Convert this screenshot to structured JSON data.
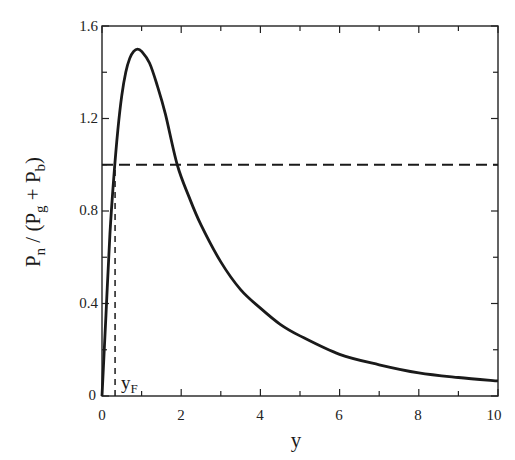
{
  "chart_data": {
    "type": "line",
    "title": "",
    "xlabel": "y",
    "ylabel": "P_n / (P_g + P_b)",
    "xlim": [
      0,
      10
    ],
    "ylim": [
      0,
      1.6
    ],
    "xticks": [
      0,
      2,
      4,
      6,
      8,
      10
    ],
    "xticks_minor": [
      1,
      3,
      5,
      7,
      9
    ],
    "yticks": [
      0,
      0.4,
      0.8,
      1.2,
      1.6
    ],
    "yticks_minor": [
      0.2,
      0.6,
      1.0,
      1.4
    ],
    "grid": false,
    "legend": null,
    "series": [
      {
        "name": "P_n / (P_g + P_b)",
        "style": "solid",
        "x": [
          0,
          0.1,
          0.2,
          0.3,
          0.4,
          0.5,
          0.6,
          0.7,
          0.8,
          0.9,
          1.0,
          1.2,
          1.4,
          1.6,
          1.9,
          2.2,
          2.5,
          3.0,
          3.5,
          4.0,
          4.5,
          5.0,
          6.0,
          7.0,
          8.0,
          9.0,
          10.0
        ],
        "y": [
          0,
          0.35,
          0.7,
          0.95,
          1.15,
          1.3,
          1.4,
          1.46,
          1.49,
          1.5,
          1.49,
          1.44,
          1.34,
          1.22,
          1.0,
          0.86,
          0.74,
          0.58,
          0.46,
          0.38,
          0.31,
          0.26,
          0.18,
          0.135,
          0.1,
          0.08,
          0.065
        ]
      },
      {
        "name": "reference level",
        "style": "dashed",
        "x": [
          0,
          10
        ],
        "y": [
          1.0,
          1.0
        ]
      },
      {
        "name": "y_F marker",
        "style": "dashed",
        "x": [
          0.33,
          0.33
        ],
        "y": [
          0,
          1.0
        ]
      }
    ],
    "annotations": [
      {
        "text": "y_F",
        "x": 0.45,
        "y": 0.05
      }
    ]
  },
  "labels": {
    "xlabel": "y",
    "ylabel_main_n": "P",
    "ylabel_sub_n": "n",
    "ylabel_mid": " / (P",
    "ylabel_sub_g": "g",
    "ylabel_plus": " + P",
    "ylabel_sub_b": "b",
    "ylabel_close": ")",
    "annotation_main": "y",
    "annotation_sub": "F",
    "xtick_labels": [
      "0",
      "2",
      "4",
      "6",
      "8",
      "10"
    ],
    "ytick_labels": [
      "0",
      "0.4",
      "0.8",
      "1.2",
      "1.6"
    ]
  }
}
